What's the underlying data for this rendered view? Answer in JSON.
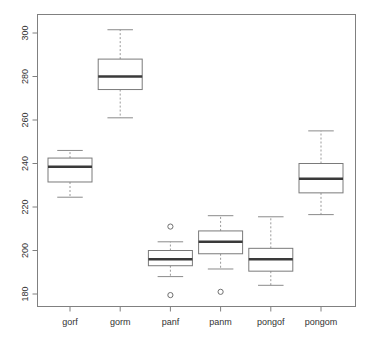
{
  "chart_data": {
    "type": "box",
    "title": "",
    "xlabel": "",
    "ylabel": "",
    "ylim": [
      176,
      308
    ],
    "yticks": [
      180,
      200,
      220,
      240,
      260,
      280,
      300
    ],
    "ytick_labels": [
      "180",
      "200",
      "220",
      "240",
      "260",
      "280",
      "300"
    ],
    "grid": false,
    "legend": "none",
    "categories": [
      "gorf",
      "gorm",
      "panf",
      "panm",
      "pongof",
      "pongom"
    ],
    "boxes": [
      {
        "label": "gorf",
        "whisker_low": 224.5,
        "q1": 231.5,
        "median": 238.5,
        "q3": 242.5,
        "whisker_high": 246,
        "outliers": []
      },
      {
        "label": "gorm",
        "whisker_low": 261,
        "q1": 274,
        "median": 280,
        "q3": 288,
        "whisker_high": 301.5,
        "outliers": []
      },
      {
        "label": "panf",
        "whisker_low": 188,
        "q1": 193,
        "median": 196,
        "q3": 200,
        "whisker_high": 204,
        "outliers": [
          211,
          179.5
        ]
      },
      {
        "label": "panm",
        "whisker_low": 191.5,
        "q1": 198.5,
        "median": 204,
        "q3": 209,
        "whisker_high": 216,
        "outliers": [
          181
        ]
      },
      {
        "label": "pongof",
        "whisker_low": 184,
        "q1": 190.5,
        "median": 196,
        "q3": 201,
        "whisker_high": 215.5,
        "outliers": []
      },
      {
        "label": "pongom",
        "whisker_low": 216.5,
        "q1": 226.5,
        "median": 233,
        "q3": 240,
        "whisker_high": 255,
        "outliers": []
      }
    ]
  },
  "colors": {
    "background": "#ffffff",
    "frame": "#808080",
    "box_stroke": "#7a7a7a",
    "median": "#3a3a3a",
    "whisker": "#9a9a9a",
    "text": "#333333"
  }
}
